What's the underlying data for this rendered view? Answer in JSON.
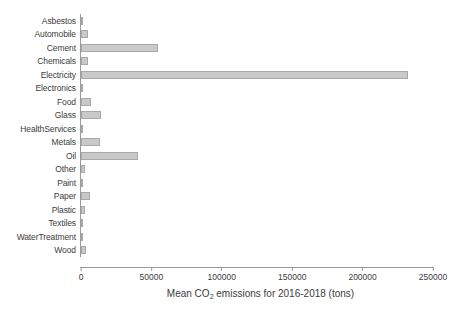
{
  "chart_data": {
    "type": "bar",
    "orientation": "horizontal",
    "title": "",
    "xlabel": "Mean CO2 emissions for 2016-2018 (tons)",
    "xlabel_parts": {
      "before": "Mean CO",
      "sub": "2",
      "after": " emissions for 2016-2018 (tons)"
    },
    "ylabel": "",
    "xlim": [
      0,
      250000
    ],
    "xticks": [
      0,
      50000,
      100000,
      150000,
      200000,
      250000
    ],
    "xticklabels": [
      "0",
      "50000",
      "100000",
      "150000",
      "200000",
      "250000"
    ],
    "grid": false,
    "legend": false,
    "bar_color": "#c9c9c9",
    "bar_edge_color": "#a9a9a9",
    "axis_color": "#9a9a9a",
    "categories": [
      "Asbestos",
      "Automobile",
      "Cement",
      "Chemicals",
      "Electricity",
      "Electronics",
      "Food",
      "Glass",
      "HealthServices",
      "Metals",
      "Oil",
      "Other",
      "Paint",
      "Paper",
      "Plastic",
      "Textiles",
      "WaterTreatment",
      "Wood"
    ],
    "values": [
      700,
      5200,
      54700,
      4800,
      232000,
      400,
      7200,
      14200,
      300,
      13500,
      40500,
      2800,
      500,
      6500,
      2600,
      400,
      300,
      3300
    ]
  }
}
